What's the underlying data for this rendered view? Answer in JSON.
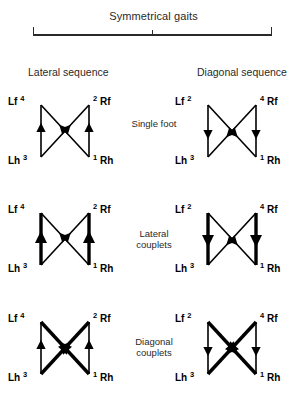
{
  "figure": {
    "bracket_label": "Symmetrical gaits",
    "columns": [
      {
        "id": "lateral-sequence",
        "label": "Lateral sequence"
      },
      {
        "id": "diagonal-sequence",
        "label": "Diagonal sequence"
      }
    ],
    "row_captions": [
      "Single foot",
      "Lateral\ncouplets",
      "Diagonal\ncouplets"
    ],
    "limb_labels": {
      "left_fore": "Lf",
      "right_fore": "Rf",
      "left_hind": "Lh",
      "right_hind": "Rh"
    },
    "colors": {
      "ink": "#000000",
      "text": "#2a2a2a",
      "background": "#ffffff"
    },
    "diagrams": [
      {
        "row": 0,
        "column": "lateral-sequence",
        "caption": "Single foot",
        "footfall_order": {
          "left_fore": "4",
          "right_fore": "2",
          "left_hind": "3",
          "right_hind": "1"
        },
        "vertical_arrows": {
          "direction": "up",
          "weight": "thin"
        },
        "diagonal_arrows": {
          "direction": "down-inward",
          "weight": "thin"
        }
      },
      {
        "row": 0,
        "column": "diagonal-sequence",
        "caption": "Single foot",
        "footfall_order": {
          "left_fore": "2",
          "right_fore": "4",
          "left_hind": "3",
          "right_hind": "1"
        },
        "vertical_arrows": {
          "direction": "down",
          "weight": "thin"
        },
        "diagonal_arrows": {
          "direction": "up-inward",
          "weight": "thin"
        }
      },
      {
        "row": 1,
        "column": "lateral-sequence",
        "caption": "Lateral couplets",
        "footfall_order": {
          "left_fore": "4",
          "right_fore": "2",
          "left_hind": "3",
          "right_hind": "1"
        },
        "vertical_arrows": {
          "direction": "up",
          "weight": "thick"
        },
        "diagonal_arrows": {
          "direction": "down-inward",
          "weight": "thin"
        }
      },
      {
        "row": 1,
        "column": "diagonal-sequence",
        "caption": "Lateral couplets",
        "footfall_order": {
          "left_fore": "2",
          "right_fore": "4",
          "left_hind": "3",
          "right_hind": "1"
        },
        "vertical_arrows": {
          "direction": "down",
          "weight": "thick"
        },
        "diagonal_arrows": {
          "direction": "up-inward",
          "weight": "thin"
        }
      },
      {
        "row": 2,
        "column": "lateral-sequence",
        "caption": "Diagonal couplets",
        "footfall_order": {
          "left_fore": "4",
          "right_fore": "2",
          "left_hind": "3",
          "right_hind": "1"
        },
        "vertical_arrows": {
          "direction": "up",
          "weight": "thin"
        },
        "diagonal_arrows": {
          "direction": "down-inward",
          "weight": "thick"
        }
      },
      {
        "row": 2,
        "column": "diagonal-sequence",
        "caption": "Diagonal couplets",
        "footfall_order": {
          "left_fore": "2",
          "right_fore": "4",
          "left_hind": "3",
          "right_hind": "1"
        },
        "vertical_arrows": {
          "direction": "down",
          "weight": "thin"
        },
        "diagonal_arrows": {
          "direction": "up-inward",
          "weight": "thick"
        }
      }
    ]
  }
}
